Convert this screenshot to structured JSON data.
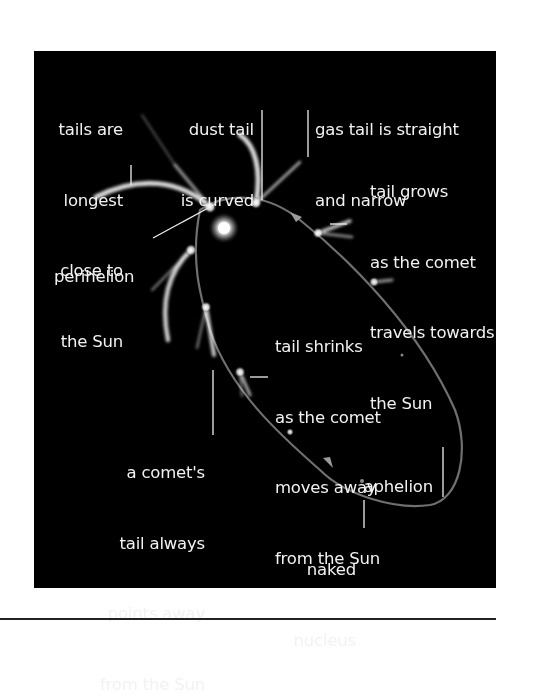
{
  "diagram": {
    "background_color": "#000000",
    "text_color": "#f2f2f2",
    "labels": {
      "tails_longest": [
        "tails are",
        "longest",
        "close to",
        "the Sun"
      ],
      "dust_tail": [
        "dust tail",
        "is curved"
      ],
      "gas_tail": [
        "gas tail is straight",
        "and narrow"
      ],
      "tail_grows": [
        "tail grows",
        "as the comet",
        "travels towards",
        "the Sun"
      ],
      "perihelion": [
        "perihelion"
      ],
      "tail_shrinks": [
        "tail shrinks",
        "as the comet",
        "moves away",
        "from the Sun"
      ],
      "tail_points": [
        "a comet's",
        "tail always",
        "points away",
        "from the Sun"
      ],
      "aphelion": [
        "aphelion"
      ],
      "naked_nucleus": [
        "naked",
        "nucleus"
      ]
    },
    "elements": {
      "sun": "sun-glow",
      "orbit": "elliptical-orbit-path",
      "direction_arrows": [
        "arrow-toward-sun",
        "arrow-away-from-sun"
      ],
      "comet_positions": 9
    }
  }
}
